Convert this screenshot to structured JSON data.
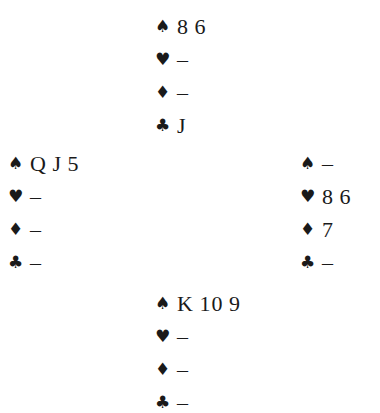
{
  "diagram": {
    "type": "bridge-deal",
    "hands": {
      "north": {
        "spades": "8 6",
        "hearts": "–",
        "diamonds": "–",
        "clubs": "J"
      },
      "west": {
        "spades": "Q J 5",
        "hearts": "–",
        "diamonds": "–",
        "clubs": "–"
      },
      "east": {
        "spades": "–",
        "hearts": "8 6",
        "diamonds": "7",
        "clubs": "–"
      },
      "south": {
        "spades": "K 10 9",
        "hearts": "–",
        "diamonds": "–",
        "clubs": "–"
      }
    },
    "suit_symbols": {
      "spades": "♠",
      "hearts": "♥",
      "diamonds": "♦",
      "clubs": "♣"
    }
  }
}
